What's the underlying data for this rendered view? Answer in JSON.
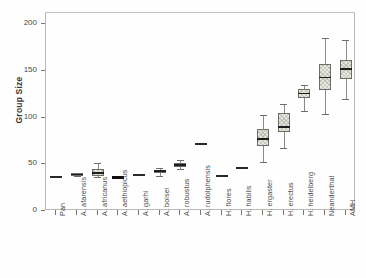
{
  "figure": {
    "background_color": "#ffffff",
    "frame_color": "#b9b9b5"
  },
  "chart_data": {
    "type": "box",
    "title": "",
    "xlabel": "",
    "ylabel": "Group Size",
    "ylim": [
      0,
      212
    ],
    "yticks": [
      0,
      50,
      100,
      150,
      200
    ],
    "ytick_labels": [
      "0",
      "50",
      "100",
      "150",
      "200"
    ],
    "grid": false,
    "legend": "none",
    "box_fill_color": "#e9e8df",
    "box_edge_color": "#6d6d69",
    "median_color": "#1d1d1d",
    "categories": [
      "Pan",
      "A. afarensis",
      "A. africanus",
      "A. aethiopicus",
      "A. garhi",
      "A. boisei",
      "A. robustus",
      "A. rudolphensis",
      "H. flores",
      "H. habilis",
      "H. ergaster",
      "H. erectus",
      "H. heidelberg",
      "Neanderthal",
      "AMH"
    ],
    "boxes": [
      {
        "category": "Pan",
        "whisker_low": 36,
        "q1": 36,
        "median": 36.5,
        "q3": 37,
        "whisker_high": 37,
        "style": "line"
      },
      {
        "category": "A. afarensis",
        "whisker_low": 37,
        "q1": 37,
        "median": 39,
        "q3": 41,
        "whisker_high": 41,
        "style": "box"
      },
      {
        "category": "A. africanus",
        "whisker_low": 36,
        "q1": 38,
        "median": 41,
        "q3": 45,
        "whisker_high": 51,
        "style": "box"
      },
      {
        "category": "A. aethiopicus",
        "whisker_low": 35,
        "q1": 35,
        "median": 36,
        "q3": 37,
        "whisker_high": 37,
        "style": "solid"
      },
      {
        "category": "A. garhi",
        "whisker_low": 38,
        "q1": 38,
        "median": 38.5,
        "q3": 39,
        "whisker_high": 39,
        "style": "line"
      },
      {
        "category": "A. boisei",
        "whisker_low": 38,
        "q1": 41,
        "median": 43,
        "q3": 44,
        "whisker_high": 46,
        "style": "box"
      },
      {
        "category": "A. robustus",
        "whisker_low": 45,
        "q1": 47,
        "median": 49,
        "q3": 51,
        "whisker_high": 55,
        "style": "box"
      },
      {
        "category": "A. rudolphensis",
        "whisker_low": 72,
        "q1": 72,
        "median": 72,
        "q3": 72,
        "whisker_high": 72,
        "style": "line"
      },
      {
        "category": "H. flores",
        "whisker_low": 37,
        "q1": 37,
        "median": 37,
        "q3": 37,
        "whisker_high": 37,
        "style": "line"
      },
      {
        "category": "H. habilis",
        "whisker_low": 46,
        "q1": 46,
        "median": 46,
        "q3": 46,
        "whisker_high": 46,
        "style": "line"
      },
      {
        "category": "H. ergaster",
        "whisker_low": 52,
        "q1": 70,
        "median": 77,
        "q3": 88,
        "whisker_high": 103,
        "style": "box"
      },
      {
        "category": "H. erectus",
        "whisker_low": 67,
        "q1": 85,
        "median": 90,
        "q3": 105,
        "whisker_high": 115,
        "style": "box"
      },
      {
        "category": "H. heidelberg",
        "whisker_low": 107,
        "q1": 121,
        "median": 126,
        "q3": 131,
        "whisker_high": 135,
        "style": "box"
      },
      {
        "category": "Neanderthal",
        "whisker_low": 104,
        "q1": 130,
        "median": 143,
        "q3": 157,
        "whisker_high": 185,
        "style": "box"
      },
      {
        "category": "AMH",
        "whisker_low": 120,
        "q1": 141,
        "median": 152,
        "q3": 162,
        "whisker_high": 183,
        "style": "box"
      }
    ]
  }
}
